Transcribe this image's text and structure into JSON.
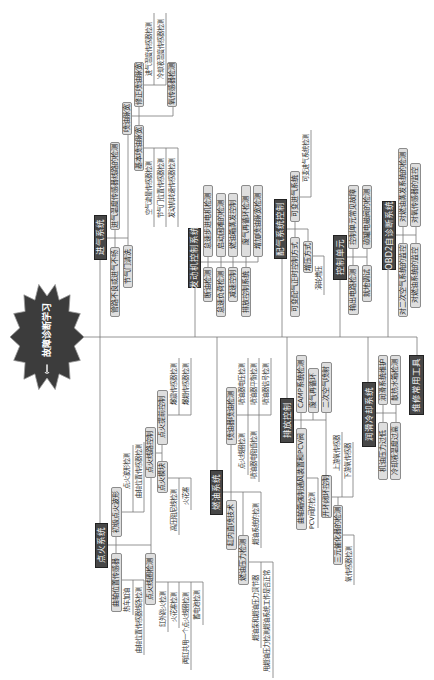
{
  "mindmap": {
    "center": "故障诊断学习",
    "center_icon": "wrench-icon",
    "colors": {
      "topic_fill": "#474747",
      "subtopic_fill": "#dedede",
      "line": "#7a7a7a",
      "center_fill": "#3c3c3c"
    },
    "intake": {
      "title": "进气系统",
      "sensor_line_check": "进气温度传感器线路的检测",
      "pipe_issue": "管路不良或进气不畅",
      "throttle_clean": "节气门清洗",
      "pulse_width": {
        "title": "喷油脉宽",
        "corrected": {
          "title": "修正喷油脉宽",
          "items": [
            "进气温度传感器检测",
            "冷却液温度传感器检测"
          ],
          "o2": "氧传感器检测"
        },
        "basic": {
          "title": "基本喷油脉宽",
          "items": [
            "空气流量传感器检测",
            "节气门位置传感器检测",
            "发动机转速传感器检测"
          ]
        }
      }
    },
    "engine_control": {
      "title": "发动机控制系统",
      "upper": [
        "怠速步进电机检测",
        "启动困难的检测",
        "燃油箱蒸发控制",
        "废气再循环检测",
        "增加喷油脉宽检测"
      ],
      "lower": [
        "断油检测",
        "怠速负荷检测",
        "减速控制",
        "排放控制系统"
      ]
    },
    "valve_timing": {
      "title": "配气系统控制",
      "variable_intake": {
        "title": "可变进气系统",
        "items": [
          "可变进气系统检测"
        ]
      },
      "variable_timing": "可变配气正时控制方式",
      "boost": {
        "title": "增压方式",
        "items": [
          "涡轮增压"
        ]
      }
    },
    "ecu": {
      "title": "控制单元",
      "upper": [
        "控制单元常见故障",
        "碳罐电磁阀的检测"
      ],
      "lower": [
        "输出电路检测",
        "就地调试"
      ]
    },
    "obd": {
      "title": "OBD2自诊断系统",
      "upper": [
        "对燃油蒸发系统的检测",
        "对氧传感器的监控"
      ],
      "lower": [
        "对二次空气系统的监控",
        "对燃油系统的监控"
      ]
    },
    "ignition": {
      "title": "点火系统",
      "waveform": {
        "title": "初级点火波形",
        "items": [
          "点火波形检测",
          "曲轴位置传感器检测"
        ]
      },
      "circuit": {
        "title": "点火线路控制",
        "advance": {
          "title": "点火提前控制",
          "items": [
            "爆震传感器检测",
            "爆燃传感器检测"
          ]
        },
        "module": {
          "title": "点火模块",
          "items": [
            "高压阻尼线检测",
            "火花塞"
          ]
        }
      },
      "crank_sensor": {
        "title": "曲轴位置传感器",
        "items": [
          "热车加油",
          "曲轴位置传感器线路检测"
        ]
      },
      "coil": {
        "title": "点火线圈检测",
        "items": [
          "缸外跳火检测",
          "火花塞检测",
          "两缸共用一个点火线圈检测",
          "蓄电池检测"
        ]
      }
    },
    "fuel": {
      "title": "燃油系统",
      "injector": {
        "title": "喷油器喷油检测",
        "upper": [
          "喷油器电压检测",
          "喷油器平衡检测",
          "喷油器信号检测"
        ],
        "lower": [
          "点火线圈检测",
          "喷油器电阻值检测"
        ]
      },
      "gdi": "缸内直喷技术",
      "pressure": {
        "title": "燃油压力检测",
        "items": [
          "燃油泵和燃油压力调节器",
          "用燃油压力检测燃油系统工作是否正常"
        ]
      },
      "system_check": "燃油系统的检测"
    },
    "emission": {
      "title": "排放控制",
      "evap": "CAMP系统检测",
      "egr": "废气再循环",
      "air": "二次空气喷射",
      "pcv": {
        "title": "曲轴箱强制通风装置和PCV阀",
        "items": [
          "PCV阀的检测"
        ]
      },
      "loop": {
        "title": "开环闭环控制",
        "items": [
          "上游氧传感器",
          "下游氧传感器"
        ]
      },
      "catalyst": {
        "title": "三元催化器的检测",
        "items": [
          "氧传感器检测"
        ]
      }
    },
    "lube_cool": {
      "title": "润滑冷却系统",
      "upper": [
        "润滑系统维护",
        "散热水箱检测"
      ],
      "lower": [
        "机油压力过低",
        "冷却液温度过高"
      ]
    },
    "tools": {
      "title": "维修常用工具"
    }
  }
}
